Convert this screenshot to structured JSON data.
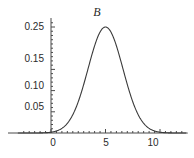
{
  "chart_data": {
    "type": "line",
    "title": "B",
    "xlabel": "",
    "ylabel": "",
    "xlim": [
      -3.0,
      12.5
    ],
    "ylim": [
      0,
      0.272
    ],
    "grid": false,
    "legend": null,
    "curve": {
      "name": "B",
      "distribution": "gaussian",
      "mean": 5.0,
      "sigma": 1.6,
      "peak_value": 0.25,
      "peak_x": 5.0,
      "color": "#3a3a3a",
      "x": [
        -3.0,
        -2.5,
        -2.0,
        -1.5,
        -1.0,
        -0.5,
        0.0,
        0.5,
        1.0,
        1.5,
        2.0,
        2.5,
        3.0,
        3.5,
        4.0,
        4.5,
        5.0,
        5.5,
        6.0,
        6.5,
        7.0,
        7.5,
        8.0,
        8.5,
        9.0,
        9.5,
        10.0,
        10.5,
        11.0,
        11.5,
        12.0,
        12.5
      ],
      "y": [
        0.0,
        0.0,
        0.0,
        0.001,
        0.001,
        0.003,
        0.005,
        0.011,
        0.021,
        0.036,
        0.058,
        0.087,
        0.122,
        0.159,
        0.195,
        0.225,
        0.25,
        0.225,
        0.195,
        0.159,
        0.122,
        0.087,
        0.058,
        0.036,
        0.021,
        0.011,
        0.005,
        0.003,
        0.001,
        0.001,
        0.0,
        0.0
      ]
    },
    "x_ticks_major": [
      0,
      5,
      10
    ],
    "x_tick_labels": [
      "0",
      "5",
      "10"
    ],
    "x_ticks_minor": [
      -2.5,
      -2.0,
      -1.5,
      -1.0,
      -0.5,
      0.5,
      1.0,
      1.5,
      2.0,
      2.5,
      3.0,
      3.5,
      4.0,
      4.5,
      5.5,
      6.0,
      6.5,
      7.0,
      7.5,
      8.0,
      8.5,
      9.0,
      9.5,
      10.5,
      11.0,
      11.5,
      12.0
    ],
    "y_ticks_major": [
      0.05,
      0.1,
      0.15,
      0.25
    ],
    "y_tick_labels": [
      "0.05",
      "0.10",
      "0.15",
      "0.25"
    ],
    "y_ticks_minor": [
      0.01,
      0.02,
      0.03,
      0.04,
      0.06,
      0.07,
      0.08,
      0.09,
      0.11,
      0.12,
      0.13,
      0.14,
      0.16,
      0.17,
      0.18,
      0.19,
      0.2,
      0.21,
      0.22,
      0.23,
      0.24,
      0.26
    ],
    "axis_color": "#4a4a4a",
    "background": "#ffffff"
  },
  "labels": {
    "title": "B",
    "y_0_05": "0.05",
    "y_0_10": "0.10",
    "y_0_15": "0.15",
    "y_0_25": "0.25",
    "x_0": "0",
    "x_5": "5",
    "x_10": "10"
  }
}
